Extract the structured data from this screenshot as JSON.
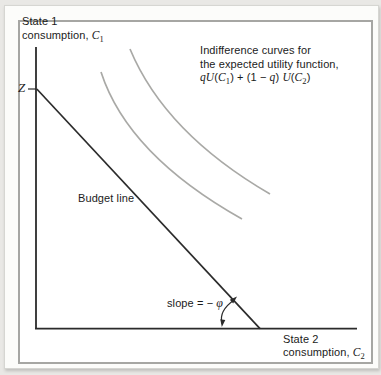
{
  "figure": {
    "y_axis_label": {
      "line1": "State 1",
      "line2_text": "consumption, ",
      "line2_var": "C",
      "line2_sub": "1"
    },
    "x_axis_label": {
      "line1": "State 2",
      "line2_text": "consumption, ",
      "line2_var": "C",
      "line2_sub": "2"
    },
    "z_marker": "Z",
    "budget_line_label": "Budget line",
    "slope_label": {
      "text": "slope = − ",
      "symbol": "φ"
    },
    "annotation": {
      "line1": "Indifference curves for",
      "line2": "the expected utility function,",
      "formula": {
        "p1": "qU",
        "p2": "(",
        "p3": "C",
        "p4": "1",
        "p5": ") + (1 − ",
        "p6": "q",
        "p7": ") ",
        "p8": "U",
        "p9": "(",
        "p10": "C",
        "p11": "2",
        "p12": ")"
      }
    },
    "colors": {
      "axis": "#2b2b2b",
      "indifference_curve": "#a9a9a6",
      "background": "#e9e8e5",
      "card": "#fcfcfa",
      "frame_border": "#a6a6a3"
    }
  }
}
